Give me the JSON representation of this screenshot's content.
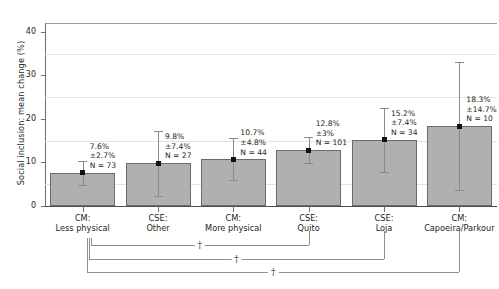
{
  "chart_data": {
    "type": "bar",
    "title": "",
    "xlabel": "",
    "ylabel": "Social inclusion: mean change (%)",
    "ylim": [
      0,
      42
    ],
    "yticks": [
      0,
      10,
      20,
      30,
      40
    ],
    "ytick_labels": [
      "0",
      "10",
      "20",
      "30",
      "40"
    ],
    "minor_gridlines": [
      5,
      15,
      25,
      35
    ],
    "grid": true,
    "legend": "none",
    "categories": [
      "CM: Less physical",
      "CSE: Other",
      "CM: More physical",
      "CSE: Quito",
      "CSE: Loja",
      "CM: Capoeira/Parkour"
    ],
    "category_lines": [
      [
        "CM:",
        "Less physical"
      ],
      [
        "CSE:",
        "Other"
      ],
      [
        "CM:",
        "More physical"
      ],
      [
        "CSE:",
        "Quito"
      ],
      [
        "CSE:",
        "Loja"
      ],
      [
        "CM:",
        "Capoeira/Parkour"
      ]
    ],
    "values": [
      7.6,
      9.8,
      10.7,
      12.8,
      15.2,
      18.3
    ],
    "errors": [
      2.7,
      7.4,
      4.8,
      3.0,
      7.4,
      14.7
    ],
    "n": [
      73,
      27,
      44,
      101,
      34,
      10
    ],
    "value_labels": [
      "7.6%",
      "9.8%",
      "10.7%",
      "12.8%",
      "15.2%",
      "18.3%"
    ],
    "error_labels": [
      "±2.7%",
      "±7.4%",
      "±4.8%",
      "±3%",
      "±7.4%",
      "±14.7%"
    ],
    "n_labels": [
      "N = 73",
      "N = 27",
      "N = 44",
      "N = 101",
      "N = 34",
      "N = 10"
    ],
    "bar_color": "#b0b0b0",
    "bar_edge_color": "#6b6b6b",
    "marker_color": "#111111",
    "error_color": "#8a8a8a",
    "significance_brackets": [
      {
        "from": "CM: Less physical",
        "to": "CSE: Quito",
        "symbol": "†"
      },
      {
        "from": "CM: Less physical",
        "to": "CSE: Loja",
        "symbol": "†"
      },
      {
        "from": "CM: Less physical",
        "to": "CM: Capoeira/Parkour",
        "symbol": "†"
      }
    ]
  }
}
